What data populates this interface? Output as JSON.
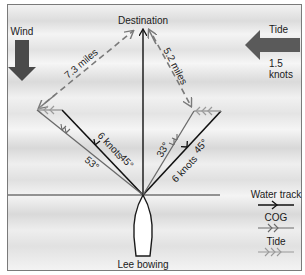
{
  "diagram": {
    "title": "Lee bowing",
    "destination_label": "Destination",
    "wind": {
      "label": "Wind",
      "direction": "down",
      "color": "#4a4a4a"
    },
    "tide": {
      "label": "Tide",
      "speed_value": "1.5",
      "speed_unit": "knots",
      "direction": "left",
      "color": "#5a5a5a"
    },
    "left_leg": {
      "water_track_speed": "6 knots",
      "water_track_angle": "45°",
      "cog_angle": "53°",
      "distance": "7.3 miles"
    },
    "right_leg": {
      "water_track_speed": "6 knots",
      "water_track_angle": "45°",
      "cog_angle": "33°",
      "distance": "5.2 miles"
    },
    "legend": {
      "items": [
        {
          "label": "Water track",
          "style": "solid-black-single-arrow"
        },
        {
          "label": "COG",
          "style": "gray-double-arrow"
        },
        {
          "label": "Tide",
          "style": "light-gray-triple-arrow"
        }
      ]
    },
    "colors": {
      "water_track": "#111111",
      "cog": "#6a6a6a",
      "tide": "#9a9a9a",
      "dashed": "#7a7a7a",
      "frame": "#7a7a7a"
    }
  }
}
